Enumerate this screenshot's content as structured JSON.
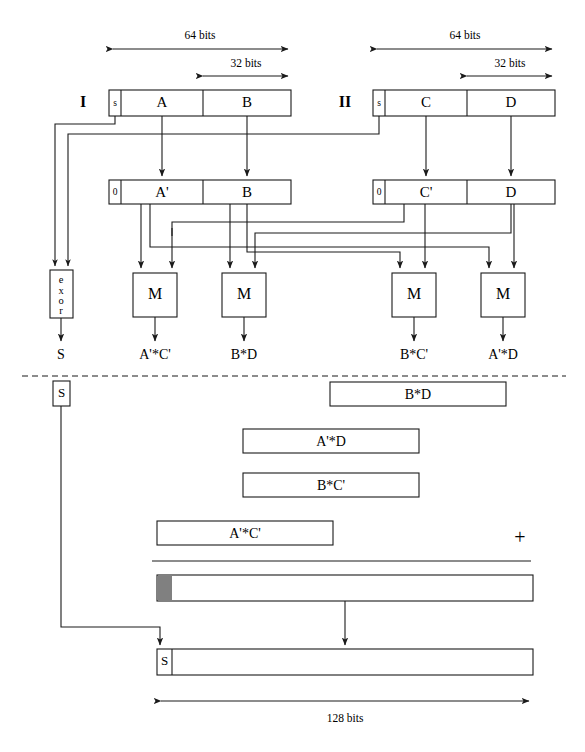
{
  "diagram": {
    "colors": {
      "stroke": "#1a1a1a",
      "fill": "#ffffff",
      "gray_block": "#808080",
      "background": "#ffffff"
    },
    "dimension_labels": {
      "top_left_wide": "64 bits",
      "top_left_narrow": "32 bits",
      "top_right_wide": "64 bits",
      "top_right_narrow": "32 bits",
      "bottom_total": "128 bits"
    },
    "operands": [
      {
        "tag": "I",
        "sign_bit": "s",
        "high_word": "A",
        "low_word": "B"
      },
      {
        "tag": "II",
        "sign_bit": "s",
        "high_word": "C",
        "low_word": "D"
      }
    ],
    "magnitude_rows": [
      {
        "sign_bit": "0",
        "high_word": "A'",
        "low_word": "B"
      },
      {
        "sign_bit": "0",
        "high_word": "C'",
        "low_word": "D"
      }
    ],
    "exor_unit": {
      "label_chars": [
        "e",
        "x",
        "o",
        "r"
      ],
      "label": "exor",
      "output_label": "S"
    },
    "multipliers": [
      {
        "label": "M",
        "output_label": "A'*C'"
      },
      {
        "label": "M",
        "output_label": "B*D"
      },
      {
        "label": "M",
        "output_label": "B*C'"
      },
      {
        "label": "M",
        "output_label": "A'*D"
      }
    ],
    "sign_carry_box": "S",
    "partial_products": [
      {
        "label": "B*D"
      },
      {
        "label": "A'*D"
      },
      {
        "label": "B*C'"
      },
      {
        "label": "A'*C'"
      }
    ],
    "adder_symbol": "+",
    "sum_bar": {
      "label": ""
    },
    "result_bar": {
      "sign_label": "S",
      "label": ""
    }
  }
}
